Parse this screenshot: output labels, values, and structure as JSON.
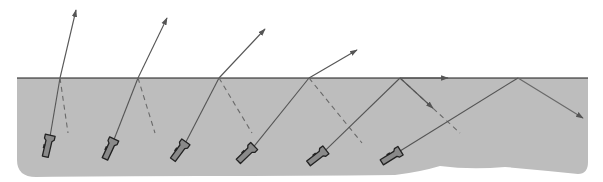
{
  "diagram": {
    "type": "refraction-and-total-internal-reflection",
    "colors": {
      "background": "#ffffff",
      "water": "#bdbdbd",
      "surface_line": "#1a1a1a",
      "beam": "#555555",
      "reflected_weak": "#6a6a6a",
      "flashlight_fill": "#8a8a8a",
      "flashlight_outline": "#222222"
    },
    "water": {
      "left": 17,
      "right": 588,
      "surface_y": 78,
      "bottom_y": 177
    },
    "flashlights": [
      {
        "id": 1,
        "x": 48,
        "y": 145,
        "angle": 13,
        "hit_x": 60,
        "refracted_end": [
          76,
          10
        ],
        "reflected_end": [
          68,
          133
        ],
        "reflected_style": "dashed",
        "case": "refraction"
      },
      {
        "id": 2,
        "x": 110,
        "y": 148,
        "angle": 25,
        "hit_x": 138,
        "refracted_end": [
          167,
          18
        ],
        "reflected_end": [
          155,
          133
        ],
        "reflected_style": "dashed",
        "case": "refraction"
      },
      {
        "id": 3,
        "x": 180,
        "y": 150,
        "angle": 36,
        "hit_x": 219,
        "refracted_end": [
          265,
          29
        ],
        "reflected_end": [
          252,
          133
        ],
        "reflected_style": "dashed",
        "case": "refraction"
      },
      {
        "id": 4,
        "x": 247,
        "y": 153,
        "angle": 46,
        "hit_x": 309,
        "refracted_end": [
          357,
          50
        ],
        "reflected_end": [
          362,
          143
        ],
        "reflected_style": "dashed",
        "case": "refraction"
      },
      {
        "id": 5,
        "x": 318,
        "y": 156,
        "angle": 52,
        "hit_x": 400,
        "refracted_end": [
          448,
          78
        ],
        "reflected_end": [
          460,
          133
        ],
        "reflected_style": "dashed",
        "case": "critical-angle"
      },
      {
        "id": 6,
        "x": 392,
        "y": 156,
        "angle": 58,
        "hit_x": 518,
        "refracted_end": null,
        "reflected_end": [
          583,
          118
        ],
        "reflected_style": "solid",
        "case": "total-internal-reflection"
      }
    ]
  }
}
